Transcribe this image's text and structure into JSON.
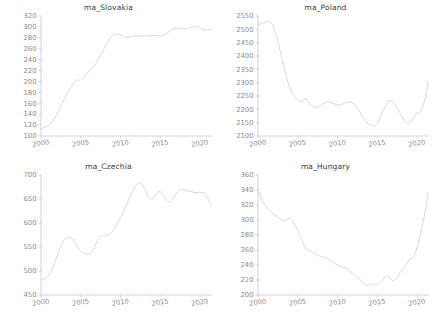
{
  "figure": {
    "background": "#ffffff",
    "line_color": "#d3d3d3",
    "axis_color": "#c9c9c9",
    "tick_label_color": "#8c8c8c",
    "title_color": "#3b3b3b",
    "layout": "2x2 grid of line charts"
  },
  "chart_data": [
    {
      "type": "line",
      "title": "ma_Slovakia",
      "xlabel": "",
      "ylabel": "",
      "xlim": [
        2000,
        2021.5
      ],
      "ylim": [
        100,
        320
      ],
      "yticks": [
        100,
        120,
        140,
        160,
        180,
        200,
        220,
        240,
        260,
        280,
        300,
        320
      ],
      "xticks": [
        2000,
        2005,
        2010,
        2015,
        2020
      ],
      "grid": false,
      "legend": "none",
      "x": [
        2000.0,
        2000.5,
        2001.0,
        2001.5,
        2002.0,
        2002.5,
        2003.0,
        2003.5,
        2004.0,
        2004.5,
        2005.0,
        2005.5,
        2006.0,
        2006.5,
        2007.0,
        2007.5,
        2008.0,
        2008.5,
        2009.0,
        2009.5,
        2010.0,
        2010.5,
        2011.0,
        2011.5,
        2012.0,
        2012.5,
        2013.0,
        2013.5,
        2014.0,
        2014.5,
        2015.0,
        2015.5,
        2016.0,
        2016.5,
        2017.0,
        2017.5,
        2018.0,
        2018.5,
        2019.0,
        2019.5,
        2020.0,
        2020.5,
        2021.0,
        2021.4
      ],
      "values": [
        113,
        116,
        120,
        128,
        140,
        155,
        170,
        183,
        195,
        202,
        203,
        210,
        218,
        226,
        235,
        248,
        262,
        275,
        284,
        287,
        285,
        282,
        281,
        283,
        284,
        283,
        283,
        284,
        284,
        284,
        283,
        285,
        290,
        296,
        298,
        297,
        296,
        297,
        300,
        301,
        298,
        294,
        295,
        296
      ]
    },
    {
      "type": "line",
      "title": "ma_Poland",
      "xlabel": "",
      "ylabel": "",
      "xlim": [
        2000,
        2021.5
      ],
      "ylim": [
        2100,
        2550
      ],
      "yticks": [
        2100,
        2150,
        2200,
        2250,
        2300,
        2350,
        2400,
        2450,
        2500,
        2550
      ],
      "xticks": [
        2000,
        2005,
        2010,
        2015,
        2020
      ],
      "grid": false,
      "legend": "none",
      "x": [
        2000.0,
        2000.5,
        2001.0,
        2001.5,
        2002.0,
        2002.5,
        2003.0,
        2003.5,
        2004.0,
        2004.5,
        2005.0,
        2005.5,
        2006.0,
        2006.5,
        2007.0,
        2007.5,
        2008.0,
        2008.5,
        2009.0,
        2009.5,
        2010.0,
        2010.5,
        2011.0,
        2011.5,
        2012.0,
        2012.5,
        2013.0,
        2013.5,
        2014.0,
        2014.5,
        2015.0,
        2015.5,
        2016.0,
        2016.5,
        2017.0,
        2017.5,
        2018.0,
        2018.5,
        2019.0,
        2019.5,
        2020.0,
        2020.5,
        2021.0,
        2021.4
      ],
      "values": [
        2518,
        2522,
        2528,
        2527,
        2505,
        2455,
        2390,
        2330,
        2280,
        2252,
        2235,
        2228,
        2240,
        2222,
        2210,
        2208,
        2215,
        2225,
        2226,
        2222,
        2216,
        2218,
        2225,
        2228,
        2222,
        2205,
        2180,
        2158,
        2142,
        2138,
        2150,
        2180,
        2210,
        2232,
        2228,
        2205,
        2178,
        2155,
        2148,
        2165,
        2185,
        2196,
        2240,
        2305
      ]
    },
    {
      "type": "line",
      "title": "ma_Czechia",
      "xlabel": "",
      "ylabel": "",
      "xlim": [
        2000,
        2021.5
      ],
      "ylim": [
        450,
        700
      ],
      "yticks": [
        450,
        500,
        550,
        600,
        650,
        700
      ],
      "xticks": [
        2000,
        2005,
        2010,
        2015,
        2020
      ],
      "grid": false,
      "legend": "none",
      "x": [
        2000.0,
        2000.5,
        2001.0,
        2001.5,
        2002.0,
        2002.5,
        2003.0,
        2003.5,
        2004.0,
        2004.5,
        2005.0,
        2005.5,
        2006.0,
        2006.5,
        2007.0,
        2007.5,
        2008.0,
        2008.5,
        2009.0,
        2009.5,
        2010.0,
        2010.5,
        2011.0,
        2011.5,
        2012.0,
        2012.5,
        2013.0,
        2013.5,
        2014.0,
        2014.5,
        2015.0,
        2015.5,
        2016.0,
        2016.5,
        2017.0,
        2017.5,
        2018.0,
        2018.5,
        2019.0,
        2019.5,
        2020.0,
        2020.5,
        2021.0,
        2021.4
      ],
      "values": [
        481,
        484,
        492,
        508,
        530,
        552,
        566,
        570,
        566,
        552,
        541,
        536,
        535,
        543,
        560,
        572,
        574,
        576,
        582,
        597,
        612,
        628,
        648,
        667,
        679,
        683,
        672,
        655,
        650,
        662,
        665,
        655,
        645,
        648,
        662,
        669,
        669,
        667,
        665,
        663,
        664,
        662,
        650,
        636
      ]
    },
    {
      "type": "line",
      "title": "ma_Hungary",
      "xlabel": "",
      "ylabel": "",
      "xlim": [
        2000,
        2021.5
      ],
      "ylim": [
        200,
        360
      ],
      "yticks": [
        200,
        220,
        240,
        260,
        280,
        300,
        320,
        340,
        360
      ],
      "xticks": [
        2000,
        2005,
        2010,
        2015,
        2020
      ],
      "grid": false,
      "legend": "none",
      "x": [
        2000.0,
        2000.5,
        2001.0,
        2001.5,
        2002.0,
        2002.5,
        2003.0,
        2003.5,
        2004.0,
        2004.5,
        2005.0,
        2005.5,
        2006.0,
        2006.5,
        2007.0,
        2007.5,
        2008.0,
        2008.5,
        2009.0,
        2009.5,
        2010.0,
        2010.5,
        2011.0,
        2011.5,
        2012.0,
        2012.5,
        2013.0,
        2013.5,
        2014.0,
        2014.5,
        2015.0,
        2015.5,
        2016.0,
        2016.5,
        2017.0,
        2017.5,
        2018.0,
        2018.5,
        2019.0,
        2019.5,
        2020.0,
        2020.5,
        2021.0,
        2021.4
      ],
      "values": [
        341,
        327,
        318,
        312,
        308,
        304,
        300,
        300,
        302,
        296,
        286,
        274,
        262,
        259,
        256,
        253,
        251,
        250,
        247,
        243,
        240,
        238,
        236,
        232,
        228,
        223,
        219,
        214,
        213,
        215,
        214,
        218,
        224,
        223,
        219,
        223,
        232,
        238,
        247,
        250,
        263,
        285,
        310,
        337
      ]
    }
  ]
}
